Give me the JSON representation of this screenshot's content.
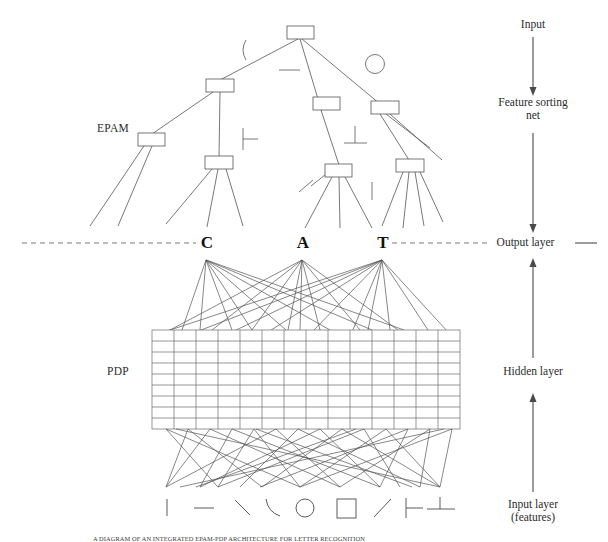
{
  "figure": {
    "modules": {
      "epam_label": "EPAM",
      "pdp_label": "PDP"
    },
    "output_letters": [
      "C",
      "A",
      "T"
    ],
    "stage_labels": [
      {
        "id": "input",
        "text": "Input"
      },
      {
        "id": "feature-sorting-net",
        "text": "Feature sorting\nnet"
      },
      {
        "id": "output-layer",
        "text": "Output layer"
      },
      {
        "id": "hidden-layer",
        "text": "Hidden layer"
      },
      {
        "id": "input-layer",
        "text": "Input layer\n(features)"
      }
    ],
    "input_features": [
      {
        "id": "vertical-bar",
        "glyph": "vertical-line-feature"
      },
      {
        "id": "horizontal-bar",
        "glyph": "horizontal-line-feature"
      },
      {
        "id": "backslash",
        "glyph": "backslash-line-feature"
      },
      {
        "id": "curve",
        "glyph": "curve-feature"
      },
      {
        "id": "circle",
        "glyph": "circle-feature"
      },
      {
        "id": "square",
        "glyph": "square-feature"
      },
      {
        "id": "forwardslash",
        "glyph": "forwardslash-line-feature"
      },
      {
        "id": "tee",
        "glyph": "tee-feature"
      },
      {
        "id": "perpendicular",
        "glyph": "perpendicular-feature"
      }
    ],
    "tree_features": [
      {
        "id": "curve-test",
        "glyph": "curve-feature"
      },
      {
        "id": "horizontal-test",
        "glyph": "horizontal-line-feature"
      },
      {
        "id": "circle-test",
        "glyph": "circle-feature"
      },
      {
        "id": "tee-test",
        "glyph": "tee-feature"
      },
      {
        "id": "perpendicular-test",
        "glyph": "perpendicular-feature"
      },
      {
        "id": "slash-test",
        "glyph": "forwardslash-line-feature"
      },
      {
        "id": "vertical-test",
        "glyph": "vertical-line-feature"
      }
    ],
    "grid": {
      "columns": 14,
      "rows": 9
    },
    "colors": {
      "stroke": "#555555",
      "text": "#2b2b2b",
      "letter": "#111111",
      "background": "#ffffff"
    },
    "caption": "A DIAGRAM OF AN INTEGRATED EPAM-PDP ARCHITECTURE FOR LETTER RECOGNITION"
  }
}
